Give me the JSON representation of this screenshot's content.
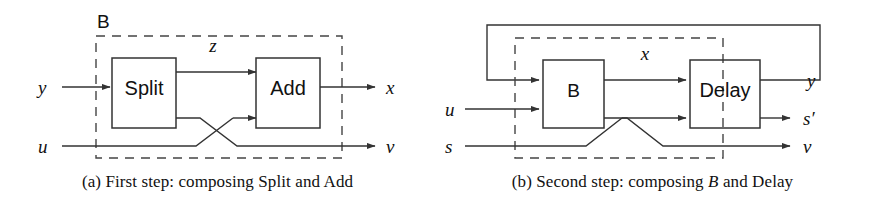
{
  "figure": {
    "panels": [
      {
        "id": "a",
        "caption_prefix": "(a) First step: composing ",
        "caption_block_1": "Split",
        "caption_mid": " and ",
        "caption_block_2": "Add",
        "caption_full": "(a) First step: composing Split and Add",
        "group_label": "B",
        "blocks": [
          {
            "name": "split-block",
            "label": "Split"
          },
          {
            "name": "add-block",
            "label": "Add"
          }
        ],
        "signals": {
          "input_top": "y",
          "input_bottom": "u",
          "internal_top": "z",
          "output_top": "x",
          "output_bottom": "v"
        }
      },
      {
        "id": "b",
        "caption_prefix": "(b) Second step: composing ",
        "caption_block_1": "B",
        "caption_mid": " and ",
        "caption_block_2": "Delay",
        "caption_full": "(b) Second step: composing B and Delay",
        "blocks": [
          {
            "name": "b-block",
            "label": "B"
          },
          {
            "name": "delay-block",
            "label": "Delay"
          }
        ],
        "signals": {
          "internal_top": "x",
          "input_mid": "u",
          "input_bottom": "s",
          "output_top": "y",
          "output_mid": "s′",
          "output_bottom": "v"
        }
      }
    ],
    "colors": {
      "stroke": "#333333",
      "dashed_stroke": "#444444",
      "text": "#111111",
      "background": "#ffffff"
    }
  }
}
